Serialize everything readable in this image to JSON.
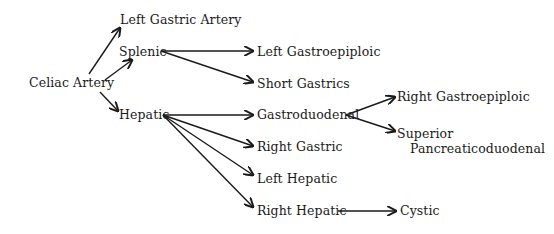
{
  "diagram": {
    "nodes": {
      "celiac": "Celiac Artery",
      "left_gastric": "Left Gastric Artery",
      "splenic": "Splenic",
      "hepatic": "Hepatic",
      "left_gastroepiploic": "Left Gastroepiploic",
      "short_gastrics": "Short Gastrics",
      "gastroduodenal": "Gastroduodenal",
      "right_gastric": "Right Gastric",
      "left_hepatic": "Left Hepatic",
      "right_hepatic": "Right Hepatic",
      "right_gastroepiploic": "Right Gastroepiploic",
      "superior_pancreaticoduodenal_line1": "Superior",
      "superior_pancreaticoduodenal_line2": "Pancreaticoduodenal",
      "cystic": "Cystic"
    },
    "edges": [
      [
        "Celiac Artery",
        "Left Gastric Artery"
      ],
      [
        "Celiac Artery",
        "Splenic"
      ],
      [
        "Celiac Artery",
        "Hepatic"
      ],
      [
        "Splenic",
        "Left Gastroepiploic"
      ],
      [
        "Splenic",
        "Short Gastrics"
      ],
      [
        "Hepatic",
        "Gastroduodenal"
      ],
      [
        "Hepatic",
        "Right Gastric"
      ],
      [
        "Hepatic",
        "Left Hepatic"
      ],
      [
        "Hepatic",
        "Right Hepatic"
      ],
      [
        "Gastroduodenal",
        "Right Gastroepiploic"
      ],
      [
        "Gastroduodenal",
        "Superior Pancreaticoduodenal"
      ],
      [
        "Right Hepatic",
        "Cystic"
      ]
    ]
  }
}
